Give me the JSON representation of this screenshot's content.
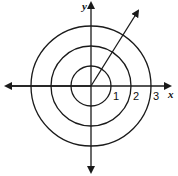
{
  "diagram": {
    "type": "polar-coordinate-grid",
    "axes": {
      "x_label": "x",
      "y_label": "y"
    },
    "circles": [
      {
        "radius": 1,
        "label": "1"
      },
      {
        "radius": 2,
        "label": "2"
      },
      {
        "radius": 3,
        "label": "3"
      }
    ],
    "ray": {
      "from": "origin",
      "direction_deg": 58,
      "arrow": true
    },
    "stroke_color": "#1a1a1a"
  }
}
